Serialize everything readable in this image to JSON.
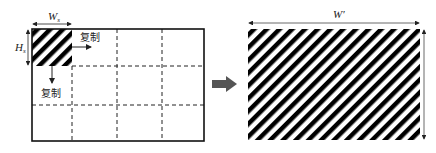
{
  "diagram": {
    "left_panel": {
      "width_label": "W",
      "width_subscript": "s",
      "height_label": "H",
      "height_subscript": "s",
      "copy_right_label": "复制",
      "copy_down_label": "复制",
      "grid": {
        "columns": 4,
        "rows": 3
      }
    },
    "transition_arrow": {
      "color": "#555555"
    },
    "right_panel": {
      "width_label": "W′"
    },
    "colors": {
      "stripe_dark": "#000000",
      "stripe_light": "#ffffff",
      "outline": "#111111",
      "dash": "#222222"
    }
  }
}
